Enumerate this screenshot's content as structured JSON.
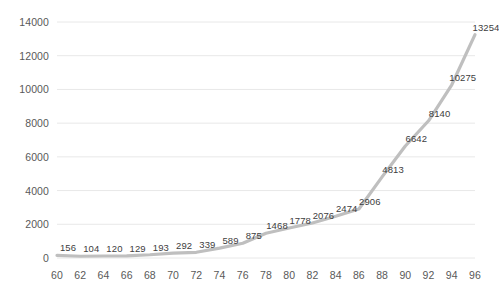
{
  "chart_data": {
    "type": "line",
    "title": "",
    "subtitle": "",
    "xlabel": "",
    "ylabel": "",
    "x": [
      60,
      62,
      64,
      66,
      68,
      70,
      72,
      74,
      76,
      78,
      80,
      82,
      84,
      86,
      88,
      90,
      92,
      94,
      96
    ],
    "values": [
      156,
      104,
      120,
      129,
      193,
      292,
      339,
      589,
      875,
      1468,
      1778,
      2076,
      2474,
      2906,
      4813,
      6642,
      8140,
      10275,
      13254
    ],
    "point_labels": [
      "156",
      "104",
      "120",
      "129",
      "193",
      "292",
      "339",
      "589",
      "875",
      "1468",
      "1778",
      "2076",
      "2474",
      "2906",
      "4813",
      "6642",
      "8140",
      "10275",
      "13254"
    ],
    "x_tick_labels": [
      "60",
      "62",
      "64",
      "66",
      "68",
      "70",
      "72",
      "74",
      "76",
      "78",
      "80",
      "82",
      "84",
      "86",
      "88",
      "90",
      "92",
      "94",
      "96"
    ],
    "y_tick_labels": [
      "0",
      "2000",
      "4000",
      "6000",
      "8000",
      "10000",
      "12000",
      "14000"
    ],
    "y_ticks": [
      0,
      2000,
      4000,
      6000,
      8000,
      10000,
      12000,
      14000
    ],
    "ylim": [
      0,
      14000
    ],
    "xlim": [
      60,
      96
    ],
    "grid": "horizontal",
    "legend": "none",
    "series_color": "#bfbfbf",
    "gridline_color": "#e8e8e8",
    "axis_text_color": "#595959",
    "label_text_color": "#404040"
  }
}
